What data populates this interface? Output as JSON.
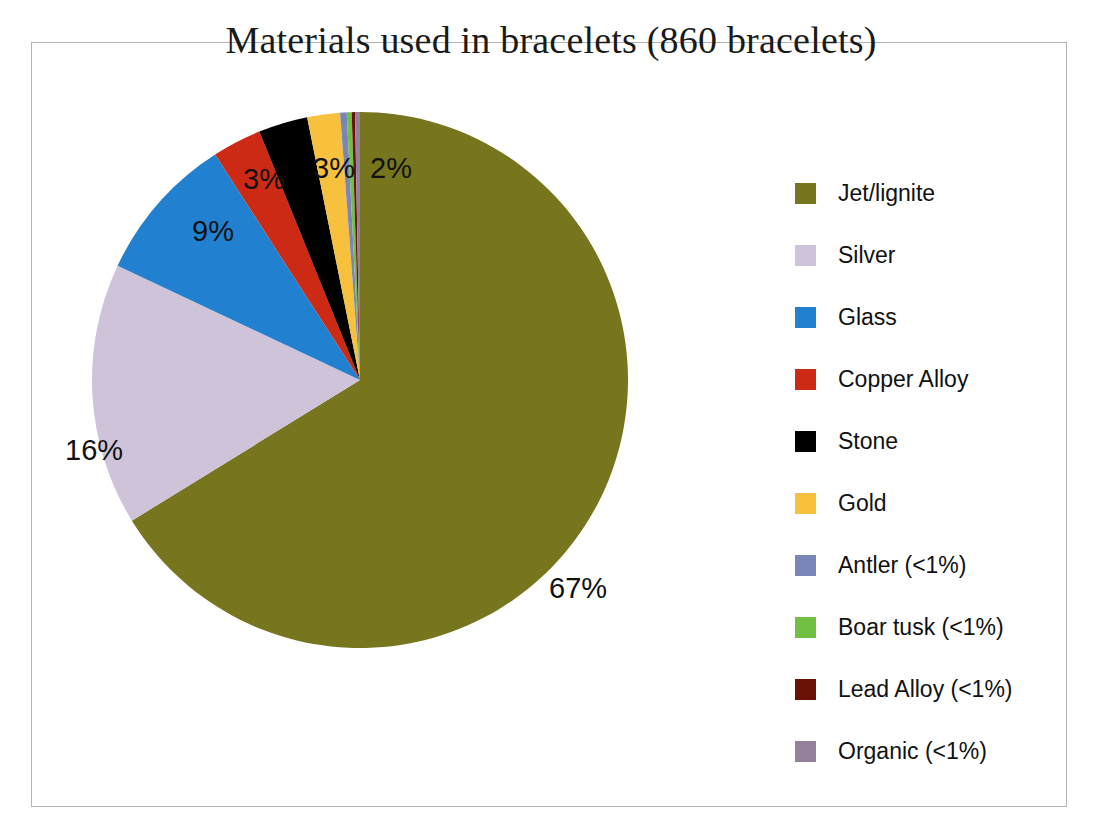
{
  "chart_data": {
    "type": "pie",
    "title": "Materials used in bracelets (860 bracelets)",
    "total_label": "860 bracelets",
    "total": 860,
    "categories": [
      "Jet/lignite",
      "Silver",
      "Glass",
      "Copper Alloy",
      "Stone",
      "Gold",
      "Antler (<1%)",
      "Boar tusk (<1%)",
      "Lead Alloy (<1%)",
      "Organic (<1%)"
    ],
    "values": [
      67,
      16,
      9,
      3,
      3,
      2,
      0.4,
      0.3,
      0.2,
      0.3
    ],
    "value_labels": [
      "67%",
      "16%",
      "9%",
      "3%",
      "3%",
      "2%",
      "<1%",
      "<1%",
      "<1%",
      "<1%"
    ],
    "displayed_labels": [
      "67%",
      "16%",
      "9%",
      "3%",
      "3%",
      "2%"
    ],
    "colors": [
      "#77761e",
      "#cfc3d9",
      "#2180cf",
      "#cd2a15",
      "#000000",
      "#f7c13d",
      "#7b86b8",
      "#72c043",
      "#6b1208",
      "#948099"
    ],
    "legend_position": "right",
    "start_angle_deg": 0,
    "direction": "clockwise",
    "xlabel": "",
    "ylabel": ""
  },
  "legend": {
    "items": [
      {
        "label": "Jet/lignite",
        "color": "#77761e"
      },
      {
        "label": "Silver",
        "color": "#cfc3d9"
      },
      {
        "label": "Glass",
        "color": "#2180cf"
      },
      {
        "label": "Copper Alloy",
        "color": "#cd2a15"
      },
      {
        "label": "Stone",
        "color": "#000000"
      },
      {
        "label": "Gold",
        "color": "#f7c13d"
      },
      {
        "label": "Antler (<1%)",
        "color": "#7b86b8"
      },
      {
        "label": "Boar tusk (<1%)",
        "color": "#72c043"
      },
      {
        "label": "Lead Alloy (<1%)",
        "color": "#6b1208"
      },
      {
        "label": "Organic (<1%)",
        "color": "#948099"
      }
    ]
  },
  "pie_labels": [
    {
      "text": "67%",
      "left": 549,
      "top": 572
    },
    {
      "text": "16%",
      "left": 65,
      "top": 434
    },
    {
      "text": "9%",
      "left": 192,
      "top": 215
    },
    {
      "text": "3%",
      "left": 243,
      "top": 163
    },
    {
      "text": "3%",
      "left": 313,
      "top": 152
    },
    {
      "text": "2%",
      "left": 370,
      "top": 152
    }
  ]
}
